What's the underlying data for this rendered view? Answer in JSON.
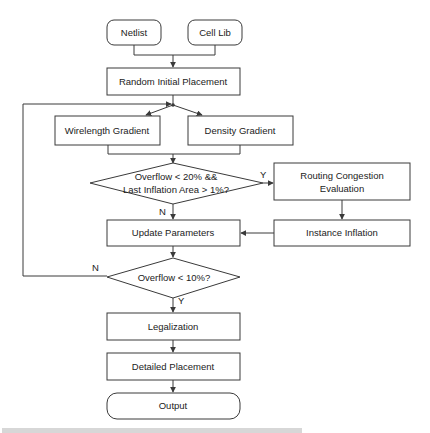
{
  "diagram": {
    "nodes": {
      "netlist": "Netlist",
      "cell_lib": "Cell Lib",
      "random_initial_placement": "Random Initial Placement",
      "wirelength_gradient": "Wirelength Gradient",
      "density_gradient": "Density Gradient",
      "decision_overflow_20": {
        "line1": "Overflow < 20% &&",
        "line2": "Last Inflation Area > 1%?"
      },
      "routing_congestion_evaluation": {
        "line1": "Routing Congestion",
        "line2": "Evaluation"
      },
      "update_parameters": "Update Parameters",
      "instance_inflation": "Instance Inflation",
      "decision_overflow_10": "Overflow < 10%?",
      "legalization": "Legalization",
      "detailed_placement": "Detailed Placement",
      "output": "Output"
    },
    "branch_labels": {
      "decision1_yes": "Y",
      "decision1_no": "N",
      "decision2_no": "N",
      "decision2_yes": "Y"
    },
    "colors": {
      "stroke": "#3a3a3a",
      "text": "#222222",
      "background": "#ffffff"
    }
  }
}
